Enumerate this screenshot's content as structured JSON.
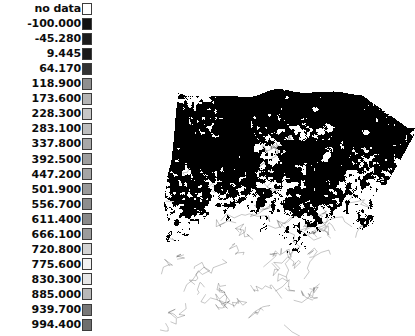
{
  "background_color": "#ffffff",
  "legend": {
    "name": "raster-value-legend",
    "no_data_label": "no data",
    "no_data_swatch_color": "#ffffff",
    "swatch_border_color": "#3c3c3c",
    "rows": [
      {
        "label": "no data",
        "color": "#ffffff"
      },
      {
        "label": "-100.000",
        "color": "#121212"
      },
      {
        "label": "-45.280",
        "color": "#1c1c1c"
      },
      {
        "label": "9.445",
        "color": "#1a1a1a"
      },
      {
        "label": "64.170",
        "color": "#333333"
      },
      {
        "label": "118.900",
        "color": "#8f8f8f"
      },
      {
        "label": "173.600",
        "color": "#b4b4b4"
      },
      {
        "label": "228.300",
        "color": "#c6c6c6"
      },
      {
        "label": "283.100",
        "color": "#bdbdbd"
      },
      {
        "label": "337.800",
        "color": "#a8a8a8"
      },
      {
        "label": "392.500",
        "color": "#9e9e9e"
      },
      {
        "label": "447.200",
        "color": "#a5a5a5"
      },
      {
        "label": "501.900",
        "color": "#9a9a9a"
      },
      {
        "label": "556.700",
        "color": "#8e8e8e"
      },
      {
        "label": "611.400",
        "color": "#8a8a8a"
      },
      {
        "label": "666.100",
        "color": "#9c9c9c"
      },
      {
        "label": "720.800",
        "color": "#d2d2d2"
      },
      {
        "label": "775.600",
        "color": "#f2f2f2"
      },
      {
        "label": "830.300",
        "color": "#e6e6e6"
      },
      {
        "label": "885.000",
        "color": "#b8b8b8"
      },
      {
        "label": "939.700",
        "color": "#787878"
      },
      {
        "label": "994.400",
        "color": "#6e6e6e"
      }
    ]
  },
  "map": {
    "name": "raster-choropleth-map",
    "fill_color": "#000000",
    "background_color": "#ffffff",
    "description": "speckled black-on-white classified raster"
  },
  "chart_data": {
    "type": "heatmap",
    "title": "",
    "xlabel": "",
    "ylabel": "",
    "legend_position": "left",
    "grid": false,
    "categories": [
      "no data",
      "-100.000",
      "-45.280",
      "9.445",
      "64.170",
      "118.900",
      "173.600",
      "228.300",
      "283.100",
      "337.800",
      "392.500",
      "447.200",
      "501.900",
      "556.700",
      "611.400",
      "666.100",
      "720.800",
      "775.600",
      "830.300",
      "885.000",
      "939.700",
      "994.400"
    ],
    "values": [
      null,
      -100.0,
      -45.28,
      9.445,
      64.17,
      118.9,
      173.6,
      228.3,
      283.1,
      337.8,
      392.5,
      447.2,
      501.9,
      556.7,
      611.4,
      666.1,
      720.8,
      775.6,
      830.3,
      885.0,
      939.7,
      994.4
    ],
    "class_interval": 54.72,
    "value_range": [
      -100.0,
      994.4
    ],
    "colormap": "grayscale"
  }
}
